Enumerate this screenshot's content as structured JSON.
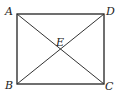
{
  "diagram": {
    "type": "geometry",
    "shape": "rectangle",
    "vertices": {
      "A": {
        "label": "A",
        "x": 17,
        "y": 14
      },
      "D": {
        "label": "D",
        "x": 104,
        "y": 14
      },
      "B": {
        "label": "B",
        "x": 17,
        "y": 84
      },
      "C": {
        "label": "C",
        "x": 104,
        "y": 84
      }
    },
    "intersection": {
      "label": "E",
      "x": 60.5,
      "y": 49
    },
    "segments": [
      "AD",
      "DC",
      "CB",
      "BA",
      "AC",
      "BD"
    ],
    "colors": {
      "line": "#222222",
      "background": "#ffffff"
    }
  }
}
